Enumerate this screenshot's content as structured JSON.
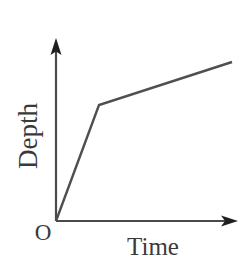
{
  "figure": {
    "background_color": "#ffffff",
    "line_color": "#4f4f4f",
    "axis_color": "#4a4a4a",
    "text_color": "#3a3a3a",
    "origin_label": "O",
    "y_axis_label": "Depth",
    "x_axis_label": "Time"
  },
  "chart_data": {
    "type": "line",
    "title": "",
    "xlabel": "Time",
    "ylabel": "Depth",
    "grid": false,
    "legend": null,
    "axes": {
      "x": {
        "label": "Time",
        "ticks": [],
        "tick_labels": [],
        "arrow": true,
        "origin_label": "O"
      },
      "y": {
        "label": "Depth",
        "ticks": [],
        "tick_labels": [],
        "arrow": true
      }
    },
    "series": [
      {
        "name": "Depth vs Time",
        "x": [
          0,
          0.33,
          1.0
        ],
        "y": [
          0,
          0.63,
          0.87
        ],
        "segments": [
          {
            "name": "steep-rise",
            "slope": "steep"
          },
          {
            "name": "shallow-rise",
            "slope": "shallow"
          }
        ]
      }
    ],
    "pixel_geometry": {
      "origin": [
        56,
        221
      ],
      "y_axis_top": [
        56,
        38
      ],
      "x_axis_right": [
        238,
        221
      ],
      "curve_points": [
        [
          56,
          221
        ],
        [
          99,
          105
        ],
        [
          232,
          62
        ]
      ]
    }
  }
}
